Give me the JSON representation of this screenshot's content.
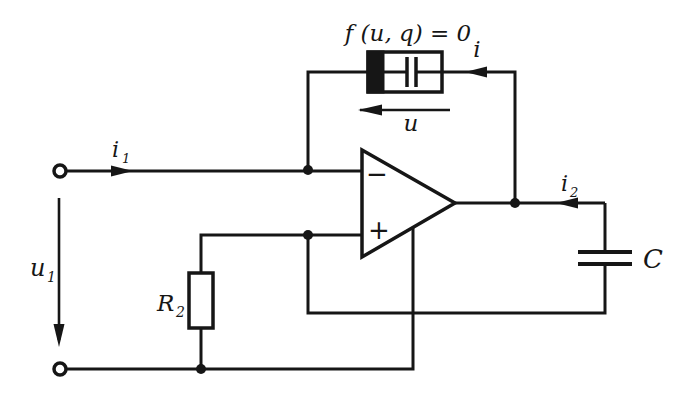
{
  "figure": {
    "type": "opamp-memcapacitor-circuit-diagram",
    "ink_color": "#161616",
    "background_color": "#ffffff",
    "memcapacitive_element": {
      "equation": "f (u, q) = 0",
      "current_label": "i",
      "voltage_label": "u"
    },
    "opamp": {
      "inverting_label": "−",
      "noninverting_label": "+"
    },
    "input_port": {
      "current": {
        "main": "i",
        "sub": "1"
      },
      "voltage": {
        "main": "u",
        "sub": "1"
      }
    },
    "output_branch": {
      "current": {
        "main": "i",
        "sub": "2"
      }
    },
    "resistor": {
      "main": "R",
      "sub": "2"
    },
    "capacitor": {
      "label": "C"
    }
  }
}
